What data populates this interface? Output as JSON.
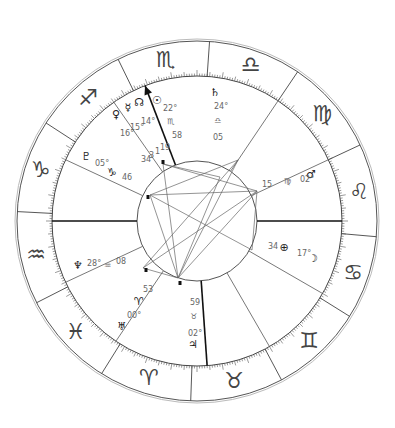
{
  "chart_type": "natal-wheel",
  "geometry": {
    "center": [
      197,
      221
    ],
    "outer_radius": 180,
    "zodiac_inner_radius": 145,
    "inner_circle_radius": 60
  },
  "signs": [
    {
      "name": "Libra",
      "glyph": "♎",
      "start_deg": 60
    },
    {
      "name": "Scorpio",
      "glyph": "♏",
      "start_deg": 90
    },
    {
      "name": "Sagittarius",
      "glyph": "♐",
      "start_deg": 120
    },
    {
      "name": "Capricorn",
      "glyph": "♑",
      "start_deg": 150
    },
    {
      "name": "Aquarius",
      "glyph": "♒",
      "start_deg": 180
    },
    {
      "name": "Pisces",
      "glyph": "♓",
      "start_deg": 210
    },
    {
      "name": "Aries",
      "glyph": "♈",
      "start_deg": 240
    },
    {
      "name": "Taurus",
      "glyph": "♉",
      "start_deg": 270
    },
    {
      "name": "Gemini",
      "glyph": "♊",
      "start_deg": 300
    },
    {
      "name": "Cancer",
      "glyph": "♋",
      "start_deg": 330
    },
    {
      "name": "Leo",
      "glyph": "♌",
      "start_deg": 0
    },
    {
      "name": "Virgo",
      "glyph": "♍",
      "start_deg": 30
    }
  ],
  "sign_boundary_angles": [
    -5,
    25,
    56,
    86,
    116,
    147,
    177,
    207,
    238,
    268,
    298,
    328
  ],
  "house_cusps": [
    {
      "house": 1,
      "angle": 180,
      "bold": true
    },
    {
      "house": 2,
      "angle": 205
    },
    {
      "house": 3,
      "angle": 236
    },
    {
      "house": 4,
      "angle": 274,
      "bold": true
    },
    {
      "house": 5,
      "angle": 300
    },
    {
      "house": 6,
      "angle": 330
    },
    {
      "house": 7,
      "angle": 0,
      "bold": true
    },
    {
      "house": 8,
      "angle": 25
    },
    {
      "house": 9,
      "angle": 56
    },
    {
      "house": 10,
      "angle": 111,
      "bold": true,
      "arrow": true
    },
    {
      "house": 11,
      "angle": 125
    },
    {
      "house": 12,
      "angle": 155
    }
  ],
  "cusp_labels": [
    {
      "text": "22°",
      "x": 163,
      "y": 111
    },
    {
      "text": "♏",
      "x": 167,
      "y": 124
    },
    {
      "text": "58",
      "x": 172,
      "y": 138
    },
    {
      "text": "24°",
      "x": 214,
      "y": 109
    },
    {
      "text": "♎",
      "x": 214,
      "y": 123
    },
    {
      "text": "05",
      "x": 213,
      "y": 140
    },
    {
      "text": "15",
      "x": 262,
      "y": 187
    },
    {
      "text": "♍",
      "x": 284,
      "y": 184
    },
    {
      "text": "02°",
      "x": 300,
      "y": 182
    },
    {
      "text": "34",
      "x": 268,
      "y": 249
    },
    {
      "text": "17°",
      "x": 297,
      "y": 256
    },
    {
      "text": "59",
      "x": 190,
      "y": 305
    },
    {
      "text": "♉",
      "x": 190,
      "y": 319
    },
    {
      "text": "02°",
      "x": 188,
      "y": 336
    },
    {
      "text": "53",
      "x": 143,
      "y": 292
    },
    {
      "text": "00°",
      "x": 127,
      "y": 318
    },
    {
      "text": "05°",
      "x": 95,
      "y": 166
    },
    {
      "text": "46",
      "x": 122,
      "y": 180
    },
    {
      "text": "28°",
      "x": 87,
      "y": 266
    },
    {
      "text": "♒",
      "x": 104,
      "y": 268
    },
    {
      "text": "08",
      "x": 116,
      "y": 264
    },
    {
      "text": "16°",
      "x": 120,
      "y": 136
    },
    {
      "text": "15°",
      "x": 130,
      "y": 130
    },
    {
      "text": "14°",
      "x": 141,
      "y": 124
    },
    {
      "text": "34",
      "x": 141,
      "y": 162
    },
    {
      "text": "3",
      "x": 149,
      "y": 158
    },
    {
      "text": "1",
      "x": 155,
      "y": 154
    },
    {
      "text": "19",
      "x": 160,
      "y": 150
    }
  ],
  "planets": [
    {
      "name": "Sun",
      "glyph": "☉",
      "x": 157,
      "y": 104
    },
    {
      "name": "Node",
      "glyph": "☊",
      "x": 139,
      "y": 106
    },
    {
      "name": "Mercury",
      "glyph": "☿",
      "x": 128,
      "y": 111
    },
    {
      "name": "Venus",
      "glyph": "♀",
      "x": 116,
      "y": 118
    },
    {
      "name": "Saturn",
      "glyph": "♄",
      "x": 215,
      "y": 96
    },
    {
      "name": "Mars",
      "glyph": "♂",
      "x": 311,
      "y": 178
    },
    {
      "name": "Uranus-like",
      "glyph": "⊕",
      "x": 284,
      "y": 251
    },
    {
      "name": "Moon",
      "glyph": "☽",
      "x": 313,
      "y": 262
    },
    {
      "name": "Pluto",
      "glyph": "♇",
      "x": 86,
      "y": 160
    },
    {
      "name": "Capricorn-cusp",
      "glyph": "♑",
      "x": 112,
      "y": 176
    },
    {
      "name": "Neptune",
      "glyph": "♆",
      "x": 78,
      "y": 269
    },
    {
      "name": "Aries-cusp",
      "glyph": "♈",
      "x": 139,
      "y": 305
    },
    {
      "name": "Uranus",
      "glyph": "♅",
      "x": 122,
      "y": 330
    },
    {
      "name": "Jupiter-small",
      "glyph": "♃",
      "x": 193,
      "y": 348
    }
  ],
  "aspect_points": [
    [
      163,
      164
    ],
    [
      150,
      195
    ],
    [
      257,
      191
    ],
    [
      143,
      268
    ],
    [
      178,
      278
    ],
    [
      238,
      160
    ],
    [
      220,
      177
    ],
    [
      252,
      250
    ]
  ],
  "aspect_lines": [
    [
      [
        150,
        195
      ],
      [
        257,
        191
      ]
    ],
    [
      [
        150,
        195
      ],
      [
        178,
        278
      ]
    ],
    [
      [
        163,
        164
      ],
      [
        178,
        278
      ]
    ],
    [
      [
        163,
        164
      ],
      [
        257,
        191
      ]
    ],
    [
      [
        143,
        268
      ],
      [
        257,
        191
      ]
    ],
    [
      [
        143,
        268
      ],
      [
        178,
        278
      ]
    ],
    [
      [
        178,
        278
      ],
      [
        257,
        191
      ]
    ],
    [
      [
        178,
        278
      ],
      [
        238,
        160
      ]
    ],
    [
      [
        150,
        195
      ],
      [
        252,
        250
      ]
    ],
    [
      [
        163,
        164
      ],
      [
        220,
        177
      ]
    ],
    [
      [
        143,
        268
      ],
      [
        238,
        160
      ]
    ],
    [
      [
        220,
        177
      ],
      [
        178,
        278
      ]
    ],
    [
      [
        238,
        160
      ],
      [
        150,
        195
      ]
    ],
    [
      [
        257,
        191
      ],
      [
        252,
        250
      ]
    ]
  ]
}
